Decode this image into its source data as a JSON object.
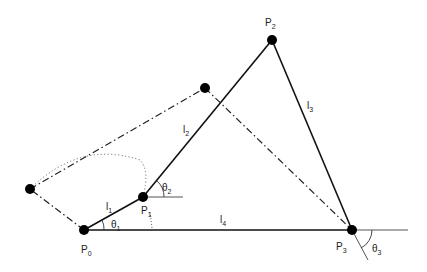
{
  "diagram": {
    "points": {
      "P0": {
        "label": "P",
        "sub": "0",
        "x": 84,
        "y": 230
      },
      "P1": {
        "label": "P",
        "sub": "1",
        "x": 143,
        "y": 197
      },
      "P2": {
        "label": "P",
        "sub": "2",
        "x": 272,
        "y": 40
      },
      "P3": {
        "label": "P",
        "sub": "3",
        "x": 352,
        "y": 230
      }
    },
    "alt_points": {
      "A": {
        "x": 30,
        "y": 189
      },
      "B": {
        "x": 205,
        "y": 88
      }
    },
    "links": [
      {
        "label": "l",
        "sub": "1"
      },
      {
        "label": "l",
        "sub": "2"
      },
      {
        "label": "l",
        "sub": "3"
      },
      {
        "label": "l",
        "sub": "4"
      }
    ],
    "angles": [
      {
        "label": "θ",
        "sub": "1"
      },
      {
        "label": "θ",
        "sub": "2"
      },
      {
        "label": "θ",
        "sub": "3"
      }
    ],
    "colors": {
      "line": "#111111",
      "ref": "#555555"
    }
  }
}
